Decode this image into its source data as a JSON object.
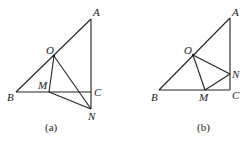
{
  "figures": [
    {
      "caption": "(a)",
      "points": {
        "A": {
          "label": "A",
          "x": 91,
          "y": 19
        },
        "O": {
          "label": "O",
          "x": 54,
          "y": 56
        },
        "B": {
          "label": "B",
          "x": 16,
          "y": 92
        },
        "M": {
          "label": "M",
          "x": 49,
          "y": 92
        },
        "C": {
          "label": "C",
          "x": 91,
          "y": 92
        },
        "N": {
          "label": "N",
          "x": 91,
          "y": 109
        }
      },
      "segments": [
        [
          "A",
          "B"
        ],
        [
          "A",
          "N"
        ],
        [
          "B",
          "C"
        ],
        [
          "O",
          "M"
        ],
        [
          "O",
          "N"
        ],
        [
          "M",
          "N"
        ]
      ]
    },
    {
      "caption": "(b)",
      "points": {
        "A": {
          "label": "A",
          "x": 230,
          "y": 18
        },
        "O": {
          "label": "O",
          "x": 193,
          "y": 55
        },
        "B": {
          "label": "B",
          "x": 159,
          "y": 90
        },
        "M": {
          "label": "M",
          "x": 205,
          "y": 90
        },
        "C": {
          "label": "C",
          "x": 230,
          "y": 90
        },
        "N": {
          "label": "N",
          "x": 230,
          "y": 74
        }
      },
      "segments": [
        [
          "A",
          "B"
        ],
        [
          "A",
          "C"
        ],
        [
          "B",
          "C"
        ],
        [
          "O",
          "M"
        ],
        [
          "O",
          "N"
        ],
        [
          "M",
          "N"
        ]
      ]
    }
  ]
}
